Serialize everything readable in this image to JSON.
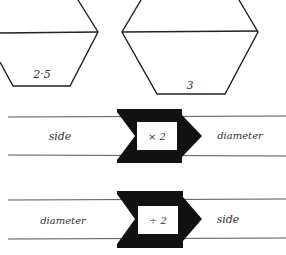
{
  "hexagons": [
    {
      "label": "2·5"
    },
    {
      "label": "3"
    }
  ],
  "machines": [
    {
      "input": "side",
      "operation": "× 2",
      "output": "diameter"
    },
    {
      "input": "diameter",
      "operation": "÷ 2",
      "output": "side"
    }
  ],
  "colors": {
    "ink": "#1a1a1a",
    "line": "#444444",
    "background": "#ffffff"
  }
}
